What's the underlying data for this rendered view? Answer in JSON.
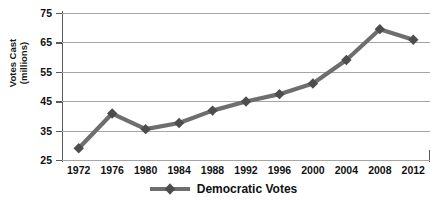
{
  "chart_data": {
    "type": "line",
    "title": "",
    "xlabel": "",
    "ylabel": "Votes Cast (millions)",
    "ylabel_line1": "Votes Cast",
    "ylabel_line2": "(millions)",
    "categories": [
      "1972",
      "1976",
      "1980",
      "1984",
      "1988",
      "1992",
      "1996",
      "2000",
      "2004",
      "2008",
      "2012"
    ],
    "series": [
      {
        "name": "Democratic Votes",
        "values": [
          29,
          40.8,
          35.5,
          37.6,
          41.8,
          44.9,
          47.4,
          51,
          59,
          69.5,
          65.9
        ]
      }
    ],
    "ylim": [
      25,
      75
    ],
    "y_ticks": [
      "25",
      "35",
      "45",
      "55",
      "65",
      "75"
    ],
    "y_tick_values": [
      25,
      35,
      45,
      55,
      65,
      75
    ],
    "grid": true,
    "grid_axis": "y",
    "legend_position": "bottom",
    "marker": "diamond",
    "series_color": "#6e6e6e",
    "grid_color": "#a6a6a6",
    "axis_color": "#5a5a5a",
    "text_color": "#111111",
    "background_color": "#ffffff"
  },
  "legend": {
    "entries": [
      {
        "label": "Democratic Votes",
        "marker": "diamond-line-marker"
      }
    ]
  }
}
